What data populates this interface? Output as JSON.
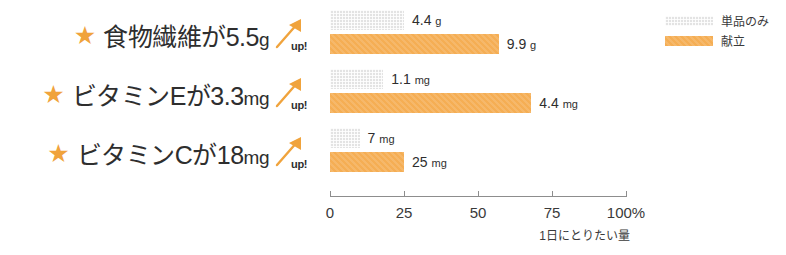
{
  "chart_data": {
    "type": "bar",
    "orientation": "horizontal",
    "title": "",
    "xlabel": "1日にとりたい量",
    "ylabel": "",
    "xlim": [
      0,
      100
    ],
    "grid": false,
    "legend_position": "top-right",
    "tick_labels": [
      "0",
      "25",
      "50",
      "75",
      "100%"
    ],
    "ticks": [
      0,
      25,
      50,
      75,
      100
    ],
    "categories": [
      "食物繊維",
      "ビタミンE",
      "ビタミンC"
    ],
    "series": [
      {
        "name": "単品のみ",
        "color": "#E3E3E3",
        "values": [
          25,
          18,
          10
        ],
        "data_labels": [
          "4.4 g",
          "1.1 mg",
          "7 mg"
        ]
      },
      {
        "name": "献立",
        "color": "#F5AE54",
        "values": [
          57,
          68,
          25
        ],
        "data_labels": [
          "9.9 g",
          "4.4 mg",
          "25 mg"
        ]
      }
    ]
  },
  "claims": [
    {
      "star": "★",
      "nutrient": "食物繊維が",
      "amount": "5.5",
      "unit": "g",
      "badge": "up!"
    },
    {
      "star": "★",
      "nutrient": "ビタミンEが",
      "amount": "3.3",
      "unit": "mg",
      "badge": "up!"
    },
    {
      "star": "★",
      "nutrient": "ビタミンCが",
      "amount": "18",
      "unit": "mg",
      "badge": "up!"
    }
  ],
  "rows": [
    {
      "gray_label": "4.4",
      "gray_unit": "g",
      "orange_label": "9.9",
      "orange_unit": "g"
    },
    {
      "gray_label": "1.1",
      "gray_unit": "mg",
      "orange_label": "4.4",
      "orange_unit": "mg"
    },
    {
      "gray_label": "7",
      "gray_unit": "mg",
      "orange_label": "25",
      "orange_unit": "mg"
    }
  ],
  "legend": {
    "items": [
      {
        "label": "単品のみ",
        "color": "#E3E3E3"
      },
      {
        "label": "献立",
        "color": "#F5AE54"
      }
    ]
  },
  "axis": {
    "caption": "1日にとりたい量",
    "labels": [
      "0",
      "25",
      "50",
      "75",
      "100%"
    ]
  },
  "colors": {
    "accent": "#F5AE54",
    "muted": "#E3E3E3",
    "text": "#2E2E2E",
    "axis": "#8D8D8D"
  }
}
